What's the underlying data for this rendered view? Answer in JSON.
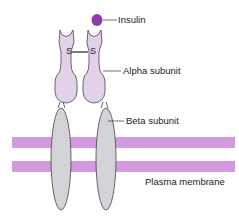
{
  "diagram": {
    "labels": {
      "insulin": "Insulin",
      "alpha": "Alpha subunit",
      "beta": "Beta subunit",
      "membrane": "Plasma membrane",
      "disulfide_left": "S",
      "disulfide_right": "S"
    },
    "colors": {
      "insulin": "#8e3ba8",
      "alpha_fill": "#e3d1ea",
      "beta_fill": "#d4d4d8",
      "membrane": "#d49ae0",
      "outline": "#444444"
    }
  }
}
